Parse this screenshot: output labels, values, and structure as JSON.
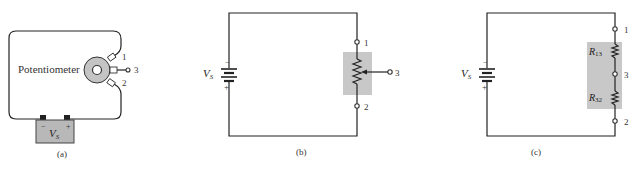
{
  "figure": {
    "panels": [
      {
        "id": "a",
        "caption": "(a)",
        "component_label": "Potentiometer",
        "source_label": "V",
        "source_subscript": "S",
        "battery_minus": "−",
        "battery_plus": "+",
        "terminals": [
          "1",
          "3",
          "2"
        ]
      },
      {
        "id": "b",
        "caption": "(b)",
        "source_label": "V",
        "source_subscript": "S",
        "battery_minus": "−",
        "battery_plus": "+",
        "terminals": [
          "1",
          "3",
          "2"
        ]
      },
      {
        "id": "c",
        "caption": "(c)",
        "source_label": "V",
        "source_subscript": "S",
        "battery_minus": "−",
        "battery_plus": "+",
        "terminals": [
          "1",
          "3",
          "2"
        ],
        "resistors": [
          {
            "label": "R",
            "subscript": "13"
          },
          {
            "label": "R",
            "subscript": "32"
          }
        ]
      }
    ],
    "colors": {
      "wire": "#222222",
      "shade": "#c8c8c8",
      "battery_case": "#b8b8b8",
      "knob": "#c4c4c4"
    }
  }
}
